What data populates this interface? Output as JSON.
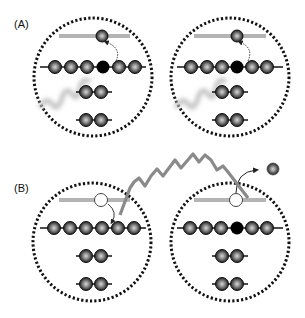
{
  "panels": [
    {
      "id": "A",
      "label": "(A)",
      "label_pos": [
        16,
        16
      ]
    },
    {
      "id": "B",
      "label": "(B)",
      "label_pos": [
        16,
        181
      ]
    }
  ],
  "colors": {
    "circle_border": "#111111",
    "bar": "#b4b4b4",
    "atom_dark": "#2a2a2a",
    "atom_highlight": "#c8c8c8",
    "atom_filled": "#000000",
    "wave_a": "#c8c8c8",
    "wave_b": "#8a8a8a",
    "hole_fill": "#ffffff",
    "arrow": "#222222"
  },
  "icons": {
    "atom": "gray-sphere-atom",
    "filled_atom": "black-atom",
    "hole": "white-hole-circle",
    "photon": "wavy-line"
  }
}
